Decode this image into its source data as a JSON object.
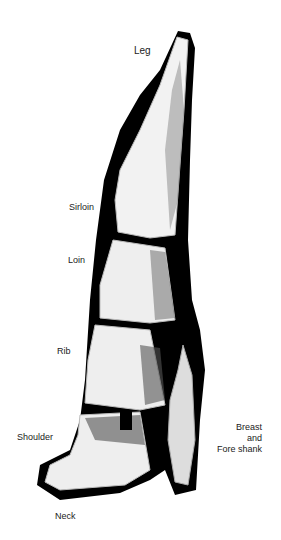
{
  "diagram": {
    "labels": {
      "leg": "Leg",
      "sirloin": "Sirloin",
      "loin": "Loin",
      "rib": "Rib",
      "shoulder": "Shoulder",
      "breast_line1": "Breast",
      "breast_line2": "and",
      "breast_line3": "Fore shank",
      "neck": "Neck"
    },
    "colors": {
      "outline": "#000000",
      "meat": "#f2f2f2",
      "shade": "#777777"
    }
  }
}
